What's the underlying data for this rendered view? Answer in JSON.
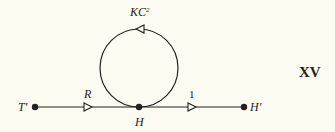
{
  "diagram": {
    "type": "signal-flow-graph",
    "figure_label": "XV",
    "nodes": [
      {
        "id": "T'",
        "label": "T'",
        "x": 35,
        "y": 107
      },
      {
        "id": "H",
        "label": "H",
        "x": 139,
        "y": 107
      },
      {
        "id": "H'",
        "label": "H'",
        "x": 244,
        "y": 107
      }
    ],
    "edges": [
      {
        "from": "T'",
        "to": "H",
        "gain": "R"
      },
      {
        "from": "H",
        "to": "H'",
        "gain": "1"
      },
      {
        "from": "H",
        "to": "H",
        "gain_base": "KC",
        "gain_sup": "2",
        "kind": "self-loop"
      }
    ],
    "colors": {
      "background": "#fbfbf2",
      "ink": "#222222"
    }
  }
}
